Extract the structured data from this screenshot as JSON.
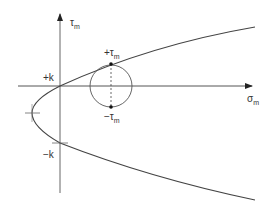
{
  "diagram": {
    "type": "stress-space yield locus (parabola) with Mohr circle",
    "axes": {
      "vertical": {
        "label_main": "τ",
        "label_sub": "m"
      },
      "horizontal": {
        "label_main": "σ",
        "label_sub": "m"
      }
    },
    "labels": {
      "plus_k": "+k",
      "minus_k": "−k",
      "plus_tau_main": "+τ",
      "plus_tau_sub": "m",
      "minus_tau_main": "−τ",
      "minus_tau_sub": "m"
    },
    "colors": {
      "line": "#444444",
      "axis": "#555555",
      "text": "#333333",
      "background": "#ffffff"
    }
  }
}
